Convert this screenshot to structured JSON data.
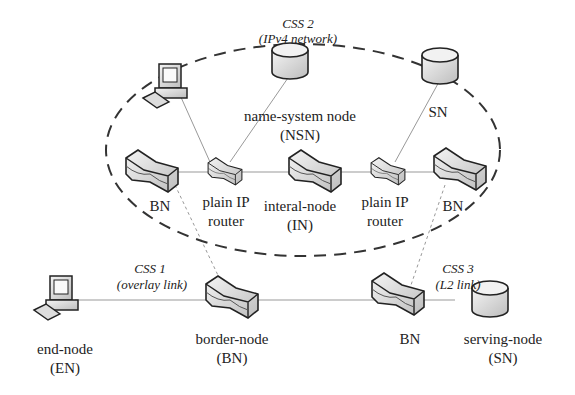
{
  "css_regions": {
    "css2": {
      "title": "CSS 2",
      "subtitle": "(IPv4 network)"
    },
    "css1": {
      "title": "CSS 1",
      "subtitle": "(overlay link)"
    },
    "css3": {
      "title": "CSS 3",
      "subtitle": "(L2 link)"
    }
  },
  "nodes": {
    "nsn": {
      "line1": "name-system node",
      "line2": "(NSN)"
    },
    "sn_top": {
      "line1": "SN"
    },
    "bn_left": {
      "line1": "BN"
    },
    "router_left": {
      "line1": "plain IP",
      "line2": "router"
    },
    "in": {
      "line1": "interal-node",
      "line2": "(IN)"
    },
    "router_right": {
      "line1": "plain IP",
      "line2": "router"
    },
    "bn_right": {
      "line1": "BN"
    },
    "en": {
      "line1": "end-node",
      "line2": "(EN)"
    },
    "bn_border": {
      "line1": "border-node",
      "line2": "(BN)"
    },
    "bn_bottom": {
      "line1": "BN"
    },
    "sn_serving": {
      "line1": "serving-node",
      "line2": "(SN)"
    }
  }
}
